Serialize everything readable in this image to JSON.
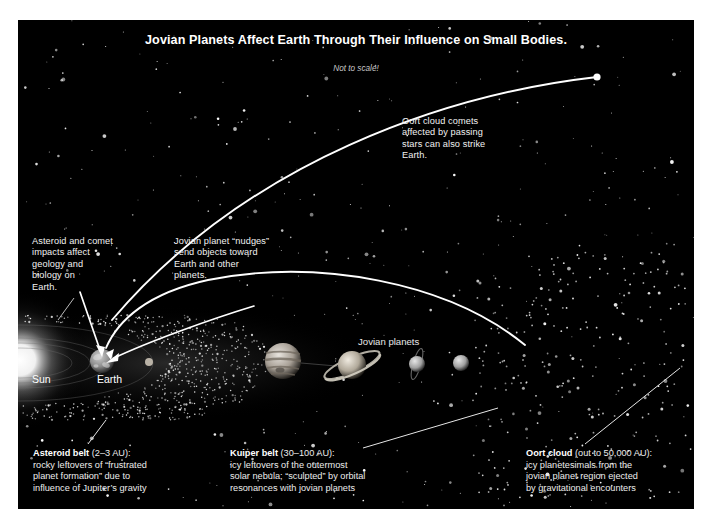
{
  "figure": {
    "title": "Jovian Planets Affect Earth Through Their Influence on Small Bodies.",
    "subtitle": "Not to scale!",
    "background_color": "#000000",
    "border_color": "#ffffff",
    "text_color": "#f2f2f2"
  },
  "labels": {
    "sun": "Sun",
    "earth": "Earth",
    "jovian_planets": "Jovian planets"
  },
  "annotations": {
    "oort_comets": "Oort cloud comets\naffected by passing\nstars can also strike\nEarth.",
    "impacts": "Asteroid and comet\nimpacts affect\ngeology and\nbiology on\nEarth.",
    "nudges": "Jovian planet “nudges”\nsend objects toward\nEarth and other\nplanets."
  },
  "captions": [
    {
      "id": "asteroid-belt",
      "heading": "Asteroid belt",
      "range": " (2–3 AU):",
      "lines": [
        "rocky leftovers of “frustrated",
        "planet formation” due to",
        "influence of Jupiter’s gravity"
      ]
    },
    {
      "id": "kuiper-belt",
      "heading": "Kuiper belt",
      "range": " (30–100 AU):",
      "lines": [
        "icy leftovers of the outermost",
        "solar nebula; “sculpted” by orbital",
        "resonances with jovian planets"
      ]
    },
    {
      "id": "oort-cloud",
      "heading": "Oort cloud",
      "range": " (out to 50,000 AU):",
      "lines": [
        "icy planetesimals from the",
        "jovian planet region ejected",
        "by gravitational encounters"
      ]
    }
  ],
  "objects": {
    "sun": {
      "name": "Sun",
      "cx": 2,
      "cy": 340,
      "glow_radius": 70
    },
    "earth": {
      "name": "Earth",
      "cx": 84,
      "cy": 341,
      "r": 12
    },
    "mars": {
      "name": "Mars",
      "cx": 131,
      "cy": 342,
      "r": 4
    },
    "jovian": [
      {
        "name": "Jupiter",
        "cx": 265,
        "cy": 341,
        "r": 18,
        "rings": false
      },
      {
        "name": "Saturn",
        "cx": 334,
        "cy": 345,
        "r": 14,
        "rings": true
      },
      {
        "name": "Uranus",
        "cx": 399,
        "cy": 344,
        "r": 8,
        "rings": true
      },
      {
        "name": "Neptune",
        "cx": 443,
        "cy": 343,
        "r": 8,
        "rings": false
      }
    ],
    "comet_marker": {
      "name": "Oort cloud comet",
      "cx": 579,
      "cy": 57,
      "r": 3.6
    }
  }
}
